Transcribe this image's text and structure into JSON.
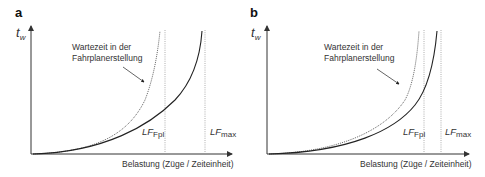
{
  "panels": [
    {
      "id": "a",
      "label": "a",
      "y_axis": {
        "symbol": "t",
        "subscript": "w"
      },
      "x_axis_label": "Belastung (Züge / Zeiteinheit)",
      "annotation": {
        "line1": "Wartezeit in der",
        "line2": "Fahrplanerstellung"
      },
      "markers": [
        {
          "symbol": "LF",
          "subscript": "Fpl"
        },
        {
          "symbol": "LF",
          "subscript": "max"
        }
      ]
    },
    {
      "id": "b",
      "label": "b",
      "y_axis": {
        "symbol": "t",
        "subscript": "w"
      },
      "x_axis_label": "Belastung (Züge / Zeiteinheit)",
      "annotation": {
        "line1": "Wartezeit in der",
        "line2": "Fahrplanerstellung"
      },
      "markers": [
        {
          "symbol": "LF",
          "subscript": "Fpl"
        },
        {
          "symbol": "LF",
          "subscript": "max"
        }
      ]
    }
  ],
  "colors": {
    "axis": "#333333",
    "curve": "#222222",
    "dotted": "#888888"
  }
}
